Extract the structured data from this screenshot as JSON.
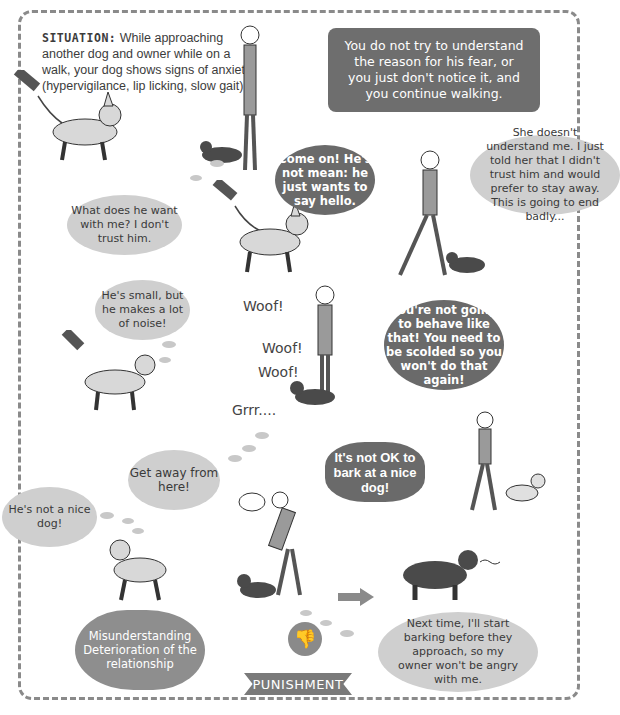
{
  "situation": {
    "label": "SITUATION:",
    "text": " While approaching another dog and owner while on a walk, your dog shows signs of anxiety (hypervigilance, lip licking, slow gait)."
  },
  "narration": "You do not try to understand the reason for his fear, or you just don't notice it, and you continue walking.",
  "panels": {
    "owner_come_on": "Come on! He's not mean: he just wants to say hello.",
    "dog1_thought_trust": "What does he want with me? I don't trust him.",
    "dog2_thought_badly": "She doesn't understand me. I just told her that I didn't trust him and would prefer to stay away. This is going to end badly...",
    "dog1_thought_small": "He's small, but he makes a lot of noise!",
    "sfx_woof1": "Woof!",
    "sfx_woof2": "Woof!",
    "sfx_woof3": "Woof!",
    "sfx_grrr": "Grrr....",
    "owner_scold": "You're not going to behave like that! You need to be scolded so you won't do that again!",
    "dog2_thought_getaway": "Get away from here!",
    "dog1_thought_notnice": "He's not a nice dog!",
    "owner_not_ok": "It's not OK to bark at a nice dog!",
    "dog2_thought_nexttime": "Next time, I'll start barking before they approach, so my owner won't be angry with me."
  },
  "outcome": {
    "consequence": "Misunderstanding Deterioration of the relationship",
    "icon": "thumbs-down-icon",
    "label": "PUNISHMENT"
  },
  "colors": {
    "dark_bubble": "#6a6a6a",
    "thought_bubble": "#cfcfcf",
    "frame_dash": "#8a8a8a",
    "banner": "#7a7a7a"
  }
}
